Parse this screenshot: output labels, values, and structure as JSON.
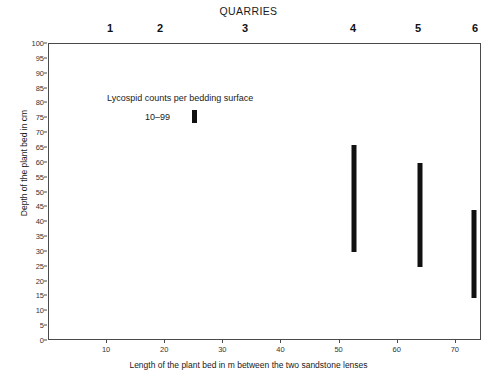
{
  "header": {
    "title": "QUARRIES",
    "quarry_labels": [
      "1",
      "2",
      "3",
      "4",
      "5",
      "6"
    ]
  },
  "legend": {
    "title": "Lycospid counts per bedding surface",
    "key_label": "10–99",
    "swatch_color": "#111111"
  },
  "axes": {
    "ylabel": "Depth of the plant bed in cm",
    "xlabel": "Length of the plant bed in m between the two sandstone lenses",
    "yticks": [
      "0",
      "5",
      "10",
      "15",
      "20",
      "25",
      "30",
      "35",
      "40",
      "45",
      "50",
      "55",
      "60",
      "65",
      "70",
      "75",
      "80",
      "85",
      "90",
      "95",
      "100"
    ],
    "xticks": [
      "10",
      "20",
      "30",
      "40",
      "50",
      "60",
      "70"
    ]
  },
  "chart_data": {
    "type": "bar",
    "title": "QUARRIES",
    "xlabel": "Length of the plant bed in m between the two sandstone lenses",
    "ylabel": "Depth of the plant bed in cm",
    "xlim": [
      0,
      74.5
    ],
    "ylim": [
      0,
      100
    ],
    "xticks": [
      10,
      20,
      30,
      40,
      50,
      60,
      70
    ],
    "yticks": [
      0,
      5,
      10,
      15,
      20,
      25,
      30,
      35,
      40,
      45,
      50,
      55,
      60,
      65,
      70,
      75,
      80,
      85,
      90,
      95,
      100
    ],
    "grid": false,
    "orientation": "vertical-range-bars",
    "legend": {
      "position": "inside-top-left",
      "title": "Lycospid counts per bedding surface",
      "entries": [
        {
          "label": "10–99",
          "color": "#111111"
        }
      ]
    },
    "quarries": [
      "1",
      "2",
      "3",
      "4",
      "5",
      "6"
    ],
    "series": [
      {
        "name": "10–99",
        "color": "#111111",
        "bars": [
          {
            "quarry": "4",
            "x": 52.5,
            "y_bottom": 30,
            "y_top": 66
          },
          {
            "quarry": "5",
            "x": 63.8,
            "y_bottom": 25,
            "y_top": 60
          },
          {
            "quarry": "6",
            "x": 73.1,
            "y_bottom": 14.5,
            "y_top": 44
          }
        ]
      }
    ]
  },
  "geometry": {
    "plot_left_px": 48,
    "plot_top_px": 43,
    "plot_width_px": 433,
    "plot_height_px": 297
  }
}
